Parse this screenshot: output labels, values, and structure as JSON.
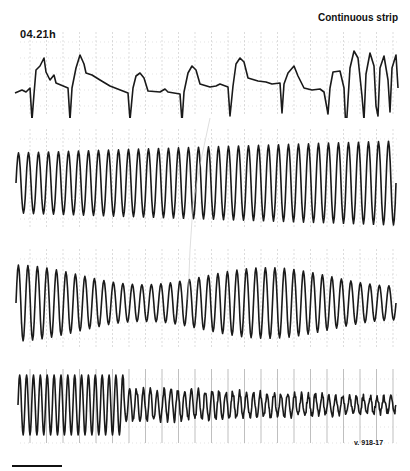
{
  "figure": {
    "time_label": "04.21h",
    "title": "Continuous strip",
    "reference": "v. 918-17",
    "colors": {
      "trace": "#1a1a1a",
      "grid": "#b8b8b8",
      "background": "#ffffff"
    }
  },
  "strips": [
    {
      "id": "strip-1",
      "top": 28,
      "height": 90,
      "description": "Sinus/wide-QRS complexes transitioning to rapid polymorphic ventricular tachycardia at right",
      "points": [
        [
          15,
          65
        ],
        [
          22,
          62
        ],
        [
          26,
          64
        ],
        [
          30,
          60
        ],
        [
          32,
          92
        ],
        [
          34,
          66
        ],
        [
          36,
          42
        ],
        [
          40,
          38
        ],
        [
          44,
          30
        ],
        [
          46,
          44
        ],
        [
          50,
          52
        ],
        [
          54,
          47
        ],
        [
          56,
          55
        ],
        [
          68,
          60
        ],
        [
          70,
          92
        ],
        [
          72,
          60
        ],
        [
          76,
          40
        ],
        [
          80,
          27
        ],
        [
          84,
          36
        ],
        [
          86,
          45
        ],
        [
          92,
          47
        ],
        [
          100,
          52
        ],
        [
          110,
          58
        ],
        [
          128,
          65
        ],
        [
          130,
          92
        ],
        [
          133,
          60
        ],
        [
          136,
          48
        ],
        [
          140,
          45
        ],
        [
          144,
          50
        ],
        [
          148,
          63
        ],
        [
          160,
          64
        ],
        [
          165,
          61
        ],
        [
          168,
          64
        ],
        [
          180,
          66
        ],
        [
          182,
          94
        ],
        [
          184,
          64
        ],
        [
          188,
          45
        ],
        [
          192,
          38
        ],
        [
          196,
          42
        ],
        [
          200,
          56
        ],
        [
          210,
          59
        ],
        [
          216,
          58
        ],
        [
          220,
          56
        ],
        [
          228,
          59
        ],
        [
          230,
          88
        ],
        [
          233,
          58
        ],
        [
          236,
          36
        ],
        [
          240,
          30
        ],
        [
          244,
          34
        ],
        [
          248,
          50
        ],
        [
          258,
          53
        ],
        [
          266,
          54
        ],
        [
          272,
          56
        ],
        [
          280,
          55
        ],
        [
          282,
          85
        ],
        [
          284,
          56
        ],
        [
          288,
          45
        ],
        [
          294,
          38
        ],
        [
          298,
          48
        ],
        [
          304,
          60
        ],
        [
          312,
          62
        ],
        [
          320,
          61
        ],
        [
          324,
          64
        ],
        [
          328,
          86
        ],
        [
          330,
          60
        ],
        [
          333,
          44
        ],
        [
          340,
          43
        ],
        [
          344,
          60
        ],
        [
          346,
          104
        ],
        [
          350,
          40
        ],
        [
          354,
          23
        ],
        [
          358,
          30
        ],
        [
          362,
          68
        ],
        [
          364,
          92
        ],
        [
          366,
          46
        ],
        [
          370,
          25
        ],
        [
          374,
          38
        ],
        [
          376,
          78
        ],
        [
          378,
          88
        ],
        [
          380,
          40
        ],
        [
          384,
          28
        ],
        [
          388,
          52
        ],
        [
          390,
          84
        ],
        [
          392,
          40
        ],
        [
          396,
          27
        ],
        [
          398,
          60
        ]
      ]
    },
    {
      "id": "strip-2",
      "top": 125,
      "height": 105,
      "description": "Polymorphic ventricular tachycardia",
      "cycles": 38,
      "x_start": 16,
      "x_end": 396,
      "baseline": 58,
      "amp_start": 30,
      "amp_end": 42
    },
    {
      "id": "strip-3",
      "top": 245,
      "height": 105,
      "description": "Torsades-like polymorphic ventricular tachycardia with waxing/waning amplitude",
      "cycles": 40,
      "x_start": 16,
      "x_end": 396,
      "baseline": 58,
      "amp_start": 38,
      "amp_end": 34
    },
    {
      "id": "strip-4",
      "top": 365,
      "height": 80,
      "description": "Degeneration into ventricular fibrillation",
      "cycles": 55,
      "x_start": 18,
      "x_end": 396,
      "baseline": 40,
      "amp_start": 30,
      "amp_end": 7
    }
  ]
}
